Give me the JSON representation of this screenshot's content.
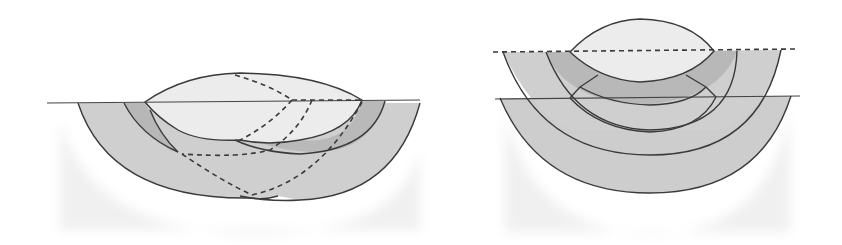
{
  "figure": {
    "panels": [
      {
        "id": "left",
        "description": "Overlapping cross-section with lens cap above surface line and two intersecting layered arcs, dashed construction lines",
        "surface_line_y": 102
      },
      {
        "id": "right",
        "description": "Concentric layered arcs beneath a lens cap, with upper dashed surface line and lower solid surface line",
        "upper_line_y": 50,
        "lower_line_y": 97
      }
    ],
    "colors": {
      "background": "#ffffff",
      "light_fill": "#e9e9e9",
      "mid_fill": "#c9c9c9",
      "dark_fill": "#b4b4b4",
      "shadow": "#efefef",
      "stroke": "#3a3a3a"
    }
  }
}
